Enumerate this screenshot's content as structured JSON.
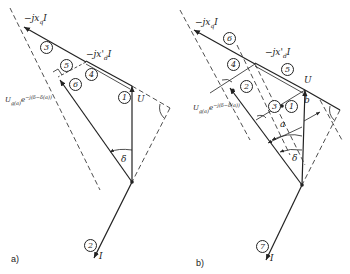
{
  "figure": {
    "panel_a": {
      "label": "a)",
      "vectors": {
        "jxq": "−jx_qI",
        "jxd": "−jx'_dI",
        "U": "U",
        "I": "I",
        "Ug": "U_g(a)e^{-j(δ-δ(a))}",
        "delta": "δ"
      },
      "text": {
        "jxq": "−jx",
        "jxq_sub": "q",
        "jxq_tail": "I",
        "jxd": "−jx'",
        "jxd_sub": "d",
        "jxd_tail": "I",
        "U": "U",
        "I": "I",
        "Ug": "U",
        "Ug_sub": "g(a)",
        "Ug_exp": "e",
        "Ug_sup": "−j(δ−δ(a))",
        "delta": "δ"
      },
      "markers": [
        "1",
        "2",
        "3",
        "4",
        "5",
        "6"
      ]
    },
    "panel_b": {
      "label": "b)",
      "text": {
        "jxq": "−jx",
        "jxq_sub": "q",
        "jxq_tail": "I",
        "jxd": "−jx'",
        "jxd_sub": "d",
        "jxd_tail": "I",
        "U": "U",
        "I": "I",
        "Ug": "U",
        "Ug_sub": "g(a)",
        "Ug_exp": "e",
        "Ug_sup": "−j(δ−δ(a))",
        "delta": "δ",
        "a": "a",
        "b": "b"
      },
      "markers": [
        "1",
        "2",
        "3",
        "4",
        "5",
        "6",
        "7"
      ]
    }
  }
}
